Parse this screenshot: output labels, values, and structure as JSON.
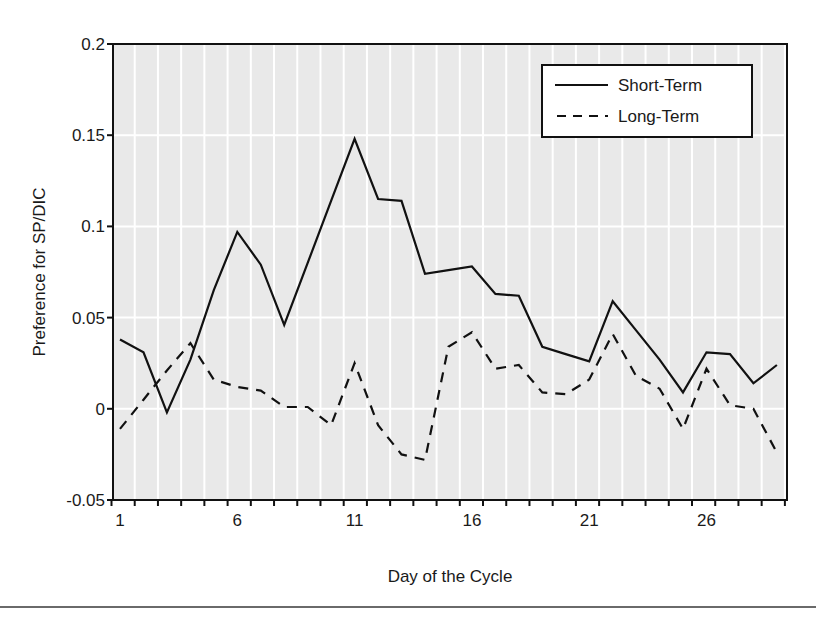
{
  "chart_data": {
    "type": "line",
    "title": "",
    "xlabel": "Day of the Cycle",
    "ylabel": "Preference for SP/DIC",
    "x": [
      1,
      2,
      3,
      4,
      5,
      6,
      7,
      8,
      9,
      10,
      11,
      12,
      13,
      14,
      15,
      16,
      17,
      18,
      19,
      20,
      21,
      22,
      23,
      24,
      25,
      26,
      27,
      28,
      29
    ],
    "x_tick_labels": [
      "1",
      "6",
      "11",
      "16",
      "21",
      "26"
    ],
    "x_tick_values": [
      1,
      6,
      11,
      16,
      21,
      26
    ],
    "y_tick_labels": [
      "-0.05",
      "0",
      "0.05",
      "0.1",
      "0.15",
      "0.2"
    ],
    "y_tick_values": [
      -0.05,
      0,
      0.05,
      0.1,
      0.15,
      0.2
    ],
    "xlim": [
      0.5,
      29.5
    ],
    "ylim": [
      -0.05,
      0.2
    ],
    "grid": true,
    "legend_position": "upper right",
    "series": [
      {
        "name": "Short-Term",
        "style": "solid",
        "values": [
          0.038,
          0.031,
          -0.002,
          0.027,
          0.065,
          0.097,
          0.079,
          0.046,
          0.08,
          0.114,
          0.148,
          0.115,
          0.114,
          0.074,
          0.076,
          0.078,
          0.063,
          0.062,
          0.034,
          0.03,
          0.026,
          0.059,
          0.043,
          0.027,
          0.009,
          0.031,
          0.03,
          0.014,
          0.024
        ]
      },
      {
        "name": "Long-Term",
        "style": "dashed",
        "values": [
          -0.011,
          0.005,
          0.021,
          0.036,
          0.016,
          0.012,
          0.01,
          0.001,
          0.001,
          -0.009,
          0.025,
          -0.009,
          -0.025,
          -0.028,
          0.034,
          0.042,
          0.022,
          0.024,
          0.009,
          0.008,
          0.016,
          0.041,
          0.018,
          0.011,
          -0.011,
          0.022,
          0.002,
          0.0,
          -0.024
        ]
      }
    ]
  },
  "colors": {
    "plot_background": "#e9e9e9",
    "gridline": "#ffffff",
    "line": "#111111",
    "axis": "#111111"
  }
}
